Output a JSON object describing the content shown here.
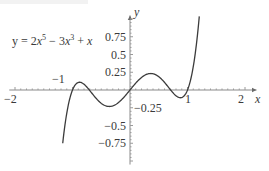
{
  "chart_data": {
    "type": "line",
    "title": "",
    "equation_label": "y = 2x⁵ − 3x³ + x",
    "equation_parts": {
      "lhs": "y = 2",
      "x1": "x",
      "exp1": "5",
      "mid": " − 3",
      "x2": "x",
      "exp2": "3",
      "tail": " + ",
      "x3": "x"
    },
    "xlabel": "x",
    "ylabel": "y",
    "xlim": [
      -2.1,
      2.2
    ],
    "ylim": [
      -1.05,
      1.05
    ],
    "grid": false,
    "legend": "none",
    "x_ticks": [
      {
        "value": -2,
        "label": "−2"
      },
      {
        "value": -1,
        "label": "−1"
      },
      {
        "value": 1,
        "label": "1"
      },
      {
        "value": 2,
        "label": "2"
      }
    ],
    "y_ticks": [
      {
        "value": 0.75,
        "label": "0.75"
      },
      {
        "value": 0.5,
        "label": "0.5"
      },
      {
        "value": 0.25,
        "label": "0.25"
      },
      {
        "value": -0.25,
        "label": "−0.25"
      },
      {
        "value": -0.5,
        "label": "−0.5"
      },
      {
        "value": -0.75,
        "label": "−0.75"
      }
    ],
    "series": [
      {
        "name": "y = 2x^5 - 3x^3 + x",
        "function": "2x^5 - 3x^3 + x",
        "x_range": [
          -1.17,
          1.205
        ],
        "x": [
          -1.17,
          -1.1,
          -1.0,
          -0.9,
          -0.85,
          -0.8,
          -0.7,
          -0.6,
          -0.5,
          -0.4,
          -0.3,
          -0.2,
          -0.1,
          0.0,
          0.1,
          0.2,
          0.3,
          0.4,
          0.5,
          0.6,
          0.7,
          0.8,
          0.85,
          0.9,
          1.0,
          1.1,
          1.205
        ],
        "values": [
          -1.01,
          -0.4,
          0.0,
          0.1,
          0.105,
          0.1,
          0.06,
          0.0,
          -0.06,
          -0.09,
          -0.11,
          -0.08,
          -0.1,
          0.0,
          0.1,
          0.08,
          0.11,
          0.09,
          0.06,
          0.0,
          -0.06,
          -0.1,
          -0.105,
          -0.1,
          0.0,
          0.4,
          1.04
        ]
      }
    ]
  },
  "layout": {
    "origin_px": [
      130,
      90
    ],
    "x_scale_px": 57.5,
    "y_scale_px": 71
  }
}
